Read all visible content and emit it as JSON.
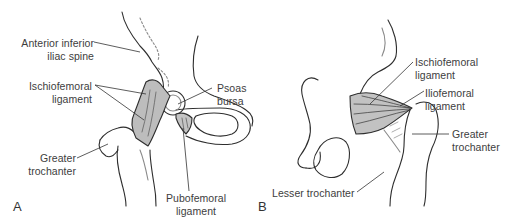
{
  "diagram": {
    "panels": [
      {
        "letter": "A",
        "labels": {
          "anterior_inferior_iliac_spine": [
            "Anterior inferior",
            "iliac spine"
          ],
          "ischiofemoral_ligament": [
            "Ischiofemoral",
            "ligament"
          ],
          "psoas_bursa": [
            "Psoas",
            "bursa"
          ],
          "greater_trochanter": [
            "Greater",
            "trochanter"
          ],
          "pubofemoral_ligament": [
            "Pubofemoral",
            "ligament"
          ]
        }
      },
      {
        "letter": "B",
        "labels": {
          "ischiofemoral_ligament": [
            "Ischiofemoral",
            "ligament"
          ],
          "iliofemoral_ligament": [
            "Iliofemoral",
            "ligament"
          ],
          "greater_trochanter": [
            "Greater",
            "trochanter"
          ],
          "lesser_trochanter": [
            "Lesser trochanter"
          ]
        }
      }
    ],
    "colors": {
      "line": "#2e2e2e",
      "ligament_fill": "#bdbdbd",
      "leader": "#333333",
      "text": "#3d3d3d",
      "background": "#ffffff"
    }
  }
}
